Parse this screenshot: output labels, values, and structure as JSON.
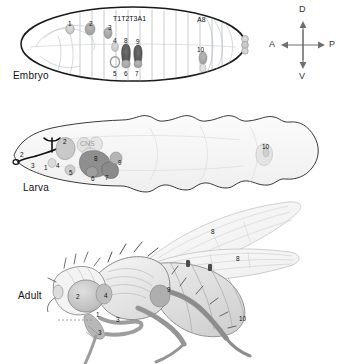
{
  "figure": {
    "stages": [
      {
        "id": "embryo",
        "label": "Embryo"
      },
      {
        "id": "larva",
        "label": "Larva"
      },
      {
        "id": "adult",
        "label": "Adult"
      }
    ]
  },
  "compass": {
    "dorsal": "D",
    "ventral": "V",
    "anterior": "A",
    "posterior": "P"
  },
  "embryo": {
    "label": "Embryo",
    "segments": [
      "T1",
      "T2",
      "T3",
      "A1",
      "A8"
    ],
    "segment_group_label": "T1T2T3A1",
    "posterior_segment_label": "A8",
    "markers": [
      {
        "n": "1",
        "x": 68,
        "y": 21
      },
      {
        "n": "2",
        "x": 89,
        "y": 21
      },
      {
        "n": "3",
        "x": 108,
        "y": 25
      },
      {
        "n": "4",
        "x": 114,
        "y": 38
      },
      {
        "n": "8",
        "x": 125,
        "y": 38
      },
      {
        "n": "9",
        "x": 137,
        "y": 39
      },
      {
        "n": "5",
        "x": 114,
        "y": 71
      },
      {
        "n": "6",
        "x": 125,
        "y": 71
      },
      {
        "n": "7",
        "x": 136,
        "y": 71
      },
      {
        "n": "10",
        "x": 197,
        "y": 50
      }
    ]
  },
  "larva": {
    "label": "Larva",
    "cns_label": "CNS",
    "markers": [
      {
        "n": "2",
        "x": 22,
        "y": 152
      },
      {
        "n": "3",
        "x": 32,
        "y": 163
      },
      {
        "n": "1",
        "x": 44,
        "y": 165
      },
      {
        "n": "2",
        "x": 63,
        "y": 140
      },
      {
        "n": "4",
        "x": 56,
        "y": 163
      },
      {
        "n": "5",
        "x": 69,
        "y": 170
      },
      {
        "n": "8",
        "x": 94,
        "y": 157
      },
      {
        "n": "6",
        "x": 92,
        "y": 175
      },
      {
        "n": "7",
        "x": 105,
        "y": 174
      },
      {
        "n": "9",
        "x": 118,
        "y": 160
      },
      {
        "n": "10",
        "x": 262,
        "y": 145
      }
    ]
  },
  "adult": {
    "label": "Adult",
    "markers": [
      {
        "n": "2",
        "x": 76,
        "y": 295
      },
      {
        "n": "1",
        "x": 96,
        "y": 313
      },
      {
        "n": "4",
        "x": 104,
        "y": 294
      },
      {
        "n": "3",
        "x": 98,
        "y": 330
      },
      {
        "n": "3",
        "x": 116,
        "y": 317
      },
      {
        "n": "9",
        "x": 167,
        "y": 288
      },
      {
        "n": "8",
        "x": 211,
        "y": 230
      },
      {
        "n": "8",
        "x": 236,
        "y": 256
      },
      {
        "n": "10",
        "x": 240,
        "y": 317
      }
    ]
  }
}
